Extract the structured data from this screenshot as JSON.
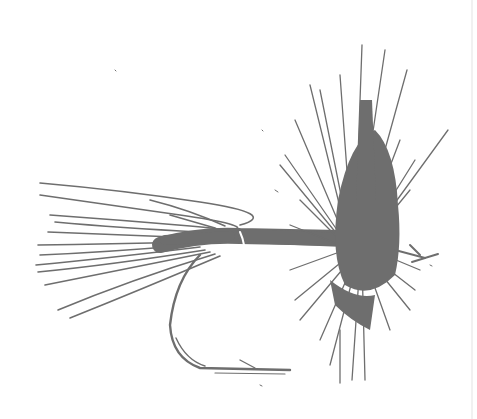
{
  "image": {
    "subject": "dry fly fishing lure illustration",
    "background_color": "#ffffff",
    "ink_color": "#6e6e6e",
    "edge_strip_color": "#f1f1f1"
  },
  "parts": {
    "tail": "tail-fibers",
    "body": "fly-body",
    "hackle": "hackle-collar",
    "hook": "hook-bend",
    "eye": "hook-eye"
  }
}
